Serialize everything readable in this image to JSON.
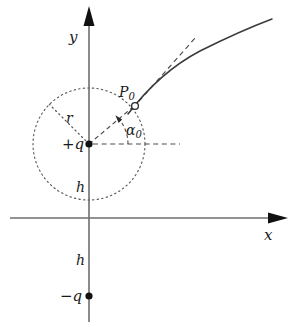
{
  "figure": {
    "background_color": "#ffffff",
    "line_color": "#3a3a3a",
    "text_color": "#1a1a1a",
    "axes": {
      "x_label": "x",
      "y_label": "y",
      "origin": {
        "x": 89,
        "y": 218
      }
    },
    "labels": {
      "positive_charge": "+q",
      "negative_charge": "−q",
      "radius": "r",
      "height_upper": "h",
      "height_lower": "h",
      "point": "P",
      "point_subscript": "0",
      "angle": "α",
      "angle_subscript": "0"
    },
    "markers": {
      "positive_charge_point": {
        "x": 89,
        "y": 144,
        "style": "filled-dot"
      },
      "negative_charge_point": {
        "x": 89,
        "y": 296,
        "style": "filled-dot"
      },
      "p0_point": {
        "x": 135,
        "y": 106,
        "style": "open-circle"
      }
    },
    "circle": {
      "center_x": 89,
      "center_y": 144,
      "radius": 56,
      "style": "dotted"
    },
    "curve": {
      "style": "solid",
      "description": "particle trajectory bending to the right"
    },
    "tangent": {
      "style": "dashed",
      "description": "tangent to trajectory at P0"
    }
  }
}
